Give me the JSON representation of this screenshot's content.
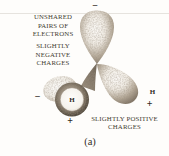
{
  "figure": {
    "type": "diagram",
    "caption": "(a)",
    "annotations": {
      "unshared_pairs": {
        "line1": "UNSHARED",
        "line2": "PAIRS OF",
        "line3": "ELECTRONS"
      },
      "negative_charges": {
        "line1": "SLIGHTLY",
        "line2": "NEGATIVE",
        "line3": "CHARGES"
      },
      "positive_charges": {
        "line1": "SLIGHTLY POSITIVE",
        "line2": "CHARGES"
      }
    },
    "atom_labels": {
      "front_hydrogen": "H",
      "right_hydrogen": "H"
    },
    "charge_signs": {
      "top_lobe": "−",
      "left_lobe": "−",
      "front_hydrogen": "+",
      "right_hydrogen": "+"
    },
    "colors": {
      "background": "#fefdfb",
      "lobe_shading": "#8d8172",
      "lobe_highlight": "#faf8f4",
      "ring_dark": "#564d41",
      "text": "#433c32",
      "sign": "#2e2923",
      "rule_line": "#e6e3de"
    }
  }
}
